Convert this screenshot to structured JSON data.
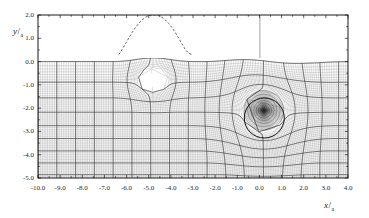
{
  "figure": {
    "kind": "computational-mesh-plot",
    "background_color": "#ffffff",
    "frame_color": "#000000",
    "mesh_line_color": "#7a7a7a",
    "block_line_color": "#2b2b2b",
    "dashed_curve_color": "#555555"
  },
  "axes": {
    "x_title_num": "x",
    "x_title_slash": "/",
    "x_title_den": "a",
    "y_title_num": "y",
    "y_title_slash": "/",
    "y_title_den": "a",
    "x_ticks": [
      "-10.0",
      "-9.0",
      "-8.0",
      "-7.0",
      "-6.0",
      "-5.0",
      "-4.0",
      "-3.0",
      "-2.0",
      "-1.0",
      "0.0",
      "1.0",
      "2.0",
      "3.0",
      "4.0"
    ],
    "y_ticks": [
      "2.0",
      "1.0",
      "0.0",
      "-1.0",
      "-2.0",
      "-3.0",
      "-4.0",
      "-5.0"
    ]
  },
  "chart_data": {
    "type": "line",
    "title": "",
    "xlabel": "x / a",
    "ylabel": "y / a",
    "xlim": [
      -10.0,
      4.0
    ],
    "ylim": [
      -5.0,
      2.0
    ],
    "xticks": [
      -10,
      -9,
      -8,
      -7,
      -6,
      -5,
      -4,
      -3,
      -2,
      -1,
      0,
      1,
      2,
      3,
      4
    ],
    "yticks": [
      2,
      1,
      0,
      -1,
      -2,
      -3,
      -4,
      -5
    ],
    "grid": false,
    "legend": "none",
    "annotations": [
      "structured multi-block quadrilateral mesh filling region y <= 0",
      "dashed free-surface / wave profile curve above y = 0 peaking near y = 2.0 at x = -4.7",
      "vertical line segment at x = 0 in the region y > 0",
      "circular inner boundary with radial mesh convergence centered near (0.2, -2.1), radius 0.9",
      "mesh void / cavity near (-4.8, -0.8)"
    ],
    "series": [
      {
        "name": "free-surface profile (dashed)",
        "style": "dashed",
        "x": [
          -6.35,
          -6.2,
          -6.05,
          -5.9,
          -5.75,
          -5.6,
          -5.45,
          -5.3,
          -5.15,
          -5.0,
          -4.85,
          -4.7,
          -4.55,
          -4.4,
          -4.25,
          -4.1,
          -3.95,
          -3.8,
          -3.65,
          -3.5,
          -3.35,
          -3.2,
          -3.05
        ],
        "y": [
          0.3,
          0.52,
          0.76,
          1.01,
          1.25,
          1.46,
          1.64,
          1.79,
          1.9,
          1.97,
          2.0,
          2.0,
          1.97,
          1.9,
          1.79,
          1.64,
          1.46,
          1.25,
          1.01,
          0.76,
          0.52,
          0.36,
          0.3
        ]
      },
      {
        "name": "mesh top boundary (y = 0 seabed/interface)",
        "style": "solid",
        "x": [
          -10.0,
          -8.0,
          -6.0,
          -4.0,
          -2.0,
          -0.5,
          0.0,
          0.6,
          1.2,
          2.0,
          3.0,
          4.0
        ],
        "y": [
          0.0,
          0.0,
          0.0,
          0.0,
          0.0,
          0.0,
          0.0,
          -0.05,
          -0.18,
          -0.1,
          -0.03,
          0.0
        ]
      }
    ],
    "circle": {
      "cx": 0.2,
      "cy": -2.1,
      "r": 0.9
    },
    "cavity": {
      "cx": -4.8,
      "cy": -0.8,
      "rx": 0.55,
      "ry": 0.42
    }
  }
}
